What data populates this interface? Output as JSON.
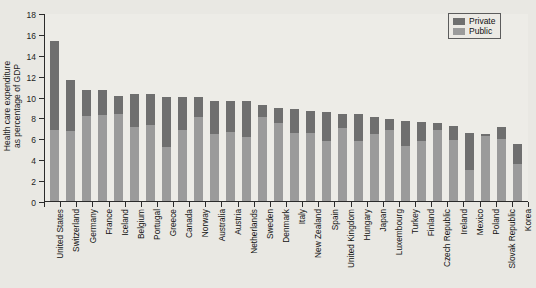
{
  "chart_data": {
    "type": "bar",
    "stacked": true,
    "title": "",
    "xlabel": "",
    "ylabel": "Health care expenditure\nas percentage of GDP",
    "ylim": [
      0,
      18
    ],
    "yticks": [
      0,
      2,
      4,
      6,
      8,
      10,
      12,
      14,
      16,
      18
    ],
    "grid": false,
    "legend_position": "top-right",
    "categories": [
      "United States",
      "Switzerland",
      "Germany",
      "France",
      "Iceland",
      "Belgium",
      "Portugal",
      "Greece",
      "Canada",
      "Norway",
      "Australia",
      "Austria",
      "Netherlands",
      "Sweden",
      "Denmark",
      "Italy",
      "New Zealand",
      "Spain",
      "United Kingdom",
      "Hungary",
      "Japan",
      "Luxembourg",
      "Turkey",
      "Finland",
      "Czech Republic",
      "Ireland",
      "Mexico",
      "Poland",
      "Slovak Republic",
      "Korea"
    ],
    "series": [
      {
        "name": "Public",
        "color": "#9b9b9b",
        "values": [
          6.8,
          6.7,
          8.1,
          8.2,
          8.3,
          7.1,
          7.3,
          5.2,
          6.8,
          8.0,
          6.4,
          6.6,
          6.1,
          8.0,
          7.5,
          6.5,
          6.5,
          5.7,
          7.0,
          5.7,
          6.4,
          6.8,
          5.3,
          5.7,
          6.8,
          5.8,
          3.0,
          6.2,
          5.9,
          3.5
        ]
      },
      {
        "name": "Private",
        "color": "#6f6f6f",
        "values": [
          8.5,
          4.9,
          2.5,
          2.4,
          1.8,
          3.1,
          2.9,
          4.8,
          3.2,
          2.0,
          3.2,
          3.0,
          3.5,
          1.2,
          1.4,
          2.3,
          2.1,
          2.8,
          1.3,
          2.6,
          1.6,
          1.1,
          2.4,
          1.9,
          0.7,
          1.4,
          3.5,
          0.2,
          1.2,
          2.0
        ]
      }
    ],
    "totals": [
      15.3,
      11.6,
      10.6,
      10.6,
      10.1,
      10.2,
      10.2,
      10.0,
      10.0,
      10.0,
      9.6,
      9.6,
      9.6,
      9.2,
      8.9,
      8.8,
      8.6,
      8.5,
      8.3,
      8.3,
      8.0,
      7.9,
      7.7,
      7.6,
      7.5,
      7.2,
      6.5,
      6.4,
      7.1,
      5.5
    ],
    "legend": [
      {
        "label": "Private",
        "color": "#6f6f6f"
      },
      {
        "label": "Public",
        "color": "#9b9b9b"
      }
    ]
  }
}
